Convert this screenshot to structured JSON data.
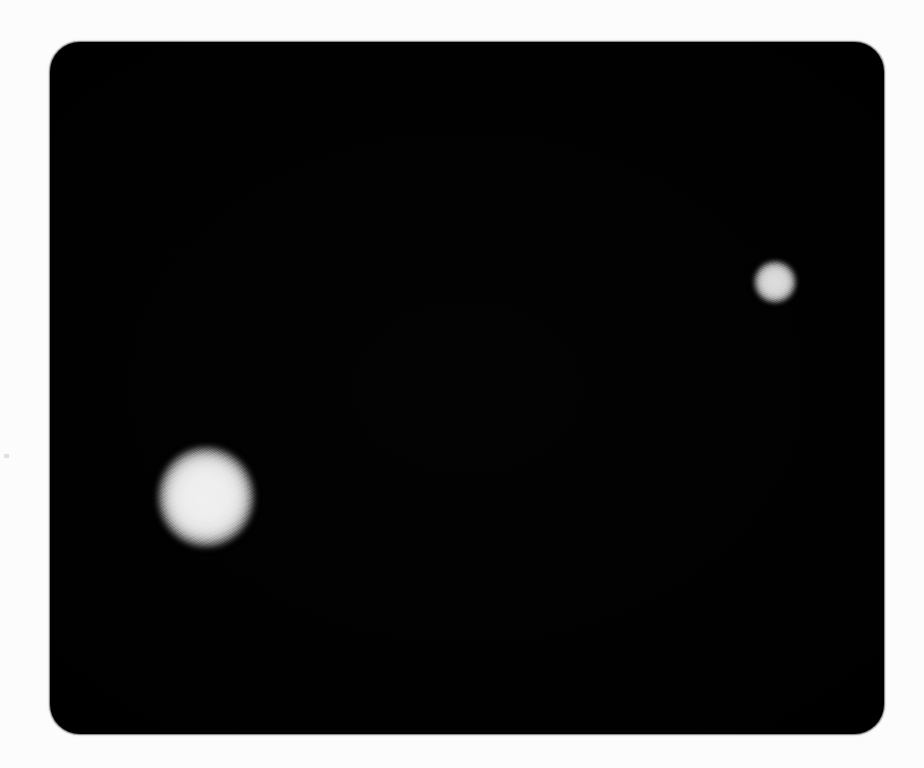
{
  "image": {
    "kind": "photograph",
    "subject": "two diffuse bright round spots on a dark rounded rectangular panel",
    "width": 924,
    "height": 768,
    "caption": "Dark rounded panel with two glowing round light spots"
  },
  "canvas": {
    "background_color": "#fcfcfc",
    "width": 924,
    "height": 768
  },
  "panel": {
    "name": "dark-panel",
    "fill_color": "#000000",
    "left": 50,
    "top": 42,
    "width": 834,
    "height": 692,
    "corner_radius": 30
  },
  "blobs": [
    {
      "id": "blob-large",
      "label": "large light spot",
      "position": "lower-left",
      "center_x": 206,
      "center_y": 497,
      "width": 102,
      "height": 106,
      "core_color": "#f1f1f1",
      "edge_color": "#000000",
      "brightness": "bright"
    },
    {
      "id": "blob-small",
      "label": "small light spot",
      "position": "upper-right",
      "center_x": 775,
      "center_y": 282,
      "width": 45,
      "height": 45,
      "core_color": "#dedede",
      "edge_color": "#000000",
      "brightness": "dim"
    }
  ],
  "artifacts": [
    {
      "id": "margin-speck",
      "label": "faint gray speck in left margin",
      "center_x": 6,
      "center_y": 456,
      "color": "#d6d6d6"
    }
  ]
}
